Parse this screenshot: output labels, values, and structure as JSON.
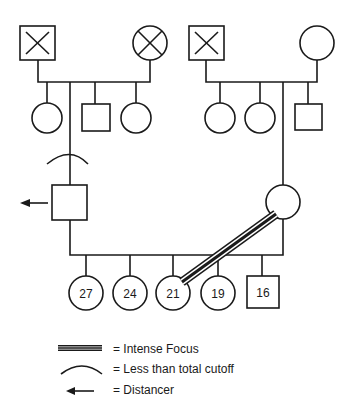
{
  "diagram": {
    "type": "genogram",
    "generations": {
      "grandparents_paternal": [
        {
          "sex": "male",
          "status": "deceased"
        },
        {
          "sex": "female",
          "status": "deceased"
        }
      ],
      "grandparents_maternal": [
        {
          "sex": "male",
          "status": "deceased"
        },
        {
          "sex": "female",
          "status": "living"
        }
      ],
      "paternal_siblings": [
        "female",
        "father",
        "male",
        "female"
      ],
      "maternal_siblings": [
        "female",
        "female",
        "mother",
        "male"
      ],
      "children": [
        {
          "sex": "female",
          "age": "27"
        },
        {
          "sex": "female",
          "age": "24"
        },
        {
          "sex": "female",
          "age": "21"
        },
        {
          "sex": "female",
          "age": "19"
        },
        {
          "sex": "male",
          "age": "16"
        }
      ]
    },
    "relationships": [
      {
        "from": "mother",
        "to": "child-21",
        "type": "Intense Focus"
      },
      {
        "from": "father",
        "to": "family-of-origin",
        "type": "Less than total cutoff"
      },
      {
        "from": "father",
        "type": "Distancer"
      }
    ]
  },
  "legend": {
    "items": [
      {
        "symbol": "triple-line",
        "label": "= Intense Focus"
      },
      {
        "symbol": "arc",
        "label": "= Less than total cutoff"
      },
      {
        "symbol": "arrow-left",
        "label": "= Distancer"
      }
    ]
  }
}
